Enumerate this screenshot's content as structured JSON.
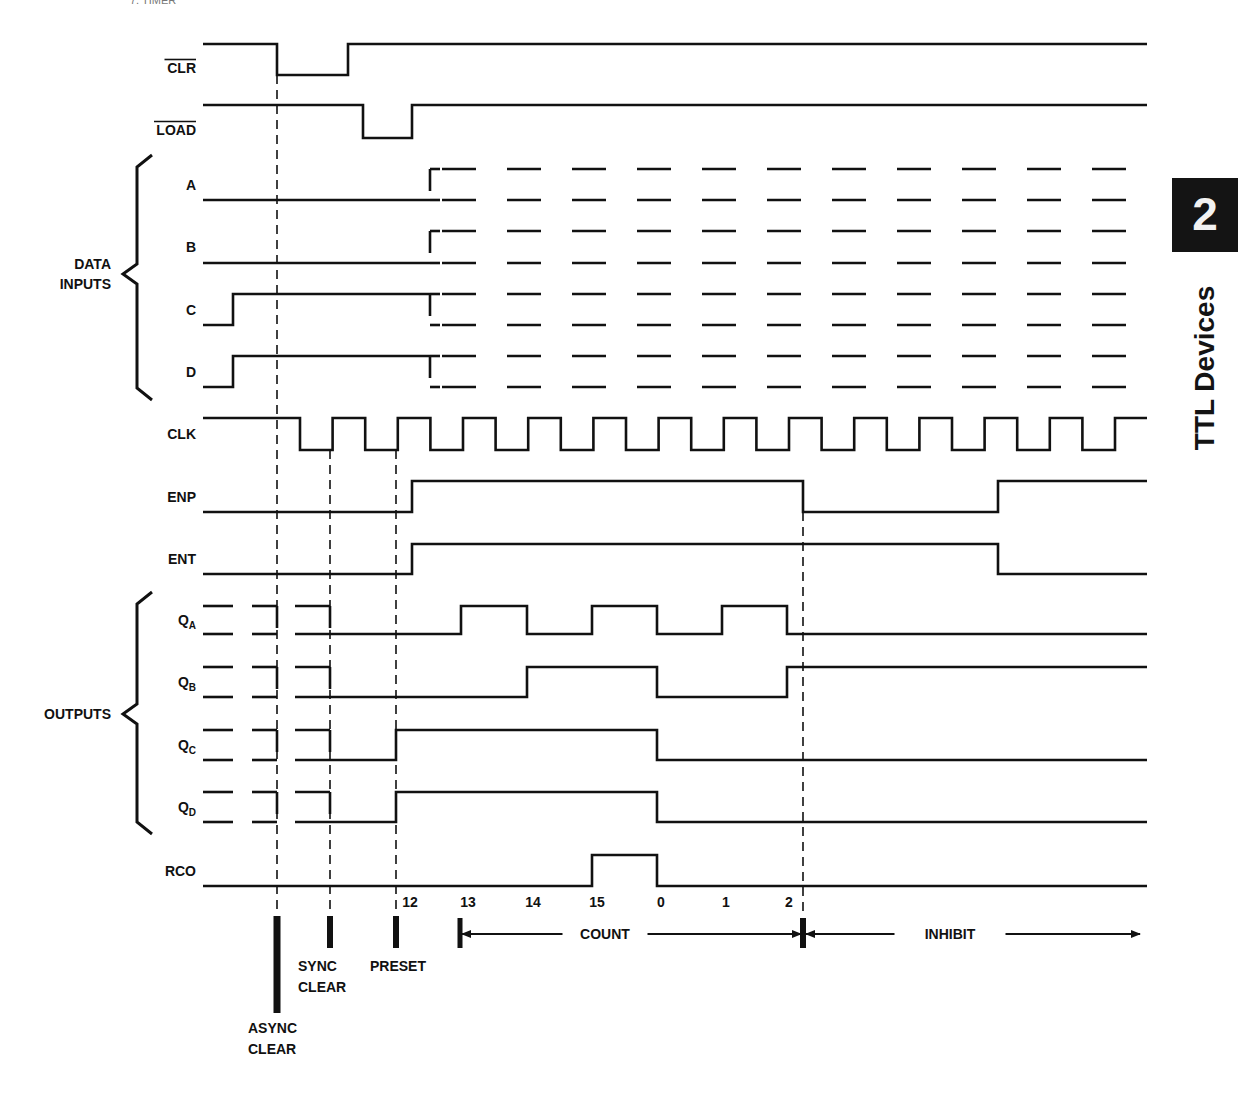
{
  "page": {
    "header_fragment": "7.  TIMER",
    "section_tab": {
      "number": "2",
      "title": "TTL Devices",
      "bg_color": "#141414"
    }
  },
  "diagram": {
    "ink_color": "#111111",
    "signals": [
      {
        "id": "clr",
        "label": "CLR",
        "overbar": true,
        "high": 44,
        "low": 75,
        "points": [
          [
            203,
            "H"
          ],
          [
            277,
            "L"
          ],
          [
            348,
            "H"
          ],
          [
            1147,
            "H"
          ]
        ]
      },
      {
        "id": "load",
        "label": "LOAD",
        "overbar": true,
        "high": 105,
        "low": 138,
        "points": [
          [
            203,
            "H"
          ],
          [
            363,
            "L"
          ],
          [
            412,
            "H"
          ],
          [
            1147,
            "H"
          ]
        ]
      },
      {
        "id": "a",
        "label": "A",
        "group": "data",
        "high": 169,
        "low": 200,
        "points": [
          [
            203,
            "L"
          ],
          [
            430,
            "L"
          ]
        ],
        "dont_care_from": 430
      },
      {
        "id": "b",
        "label": "B",
        "group": "data",
        "high": 231,
        "low": 263,
        "points": [
          [
            203,
            "L"
          ],
          [
            430,
            "L"
          ]
        ],
        "dont_care_from": 430
      },
      {
        "id": "c",
        "label": "C",
        "group": "data",
        "high": 294,
        "low": 325,
        "points": [
          [
            203,
            "L"
          ],
          [
            233,
            "H"
          ],
          [
            430,
            "H"
          ]
        ],
        "dont_care_from": 430
      },
      {
        "id": "d",
        "label": "D",
        "group": "data",
        "high": 356,
        "low": 387,
        "points": [
          [
            203,
            "L"
          ],
          [
            233,
            "H"
          ],
          [
            430,
            "H"
          ]
        ],
        "dont_care_from": 430
      },
      {
        "id": "clk",
        "label": "CLK",
        "high": 418,
        "low": 450,
        "clock": {
          "start": 203,
          "first_fall": 300,
          "half_period": 32.6,
          "end": 1147,
          "cycles": 13
        }
      },
      {
        "id": "enp",
        "label": "ENP",
        "high": 481,
        "low": 512,
        "points": [
          [
            203,
            "L"
          ],
          [
            412,
            "H"
          ],
          [
            803,
            "L"
          ],
          [
            998,
            "H"
          ],
          [
            1147,
            "H"
          ]
        ]
      },
      {
        "id": "ent",
        "label": "ENT",
        "high": 544,
        "low": 574,
        "points": [
          [
            203,
            "L"
          ],
          [
            412,
            "H"
          ],
          [
            998,
            "L"
          ],
          [
            1147,
            "L"
          ]
        ]
      },
      {
        "id": "qa",
        "label": "Q",
        "sub": "A",
        "group": "out",
        "high": 606,
        "low": 634,
        "dont_care_until": 330,
        "points": [
          [
            330,
            "L"
          ],
          [
            461,
            "H"
          ],
          [
            527,
            "L"
          ],
          [
            592,
            "H"
          ],
          [
            657,
            "L"
          ],
          [
            722,
            "H"
          ],
          [
            787,
            "L"
          ],
          [
            1147,
            "L"
          ]
        ]
      },
      {
        "id": "qb",
        "label": "Q",
        "sub": "B",
        "group": "out",
        "high": 667,
        "low": 697,
        "dont_care_until": 330,
        "points": [
          [
            330,
            "L"
          ],
          [
            527,
            "H"
          ],
          [
            657,
            "L"
          ],
          [
            787,
            "H"
          ],
          [
            1147,
            "H"
          ]
        ]
      },
      {
        "id": "qc",
        "label": "Q",
        "sub": "C",
        "group": "out",
        "high": 730,
        "low": 760,
        "dont_care_until": 330,
        "points": [
          [
            330,
            "L"
          ],
          [
            396,
            "H"
          ],
          [
            657,
            "L"
          ],
          [
            1147,
            "L"
          ]
        ]
      },
      {
        "id": "qd",
        "label": "Q",
        "sub": "D",
        "group": "out",
        "high": 792,
        "low": 822,
        "dont_care_until": 330,
        "points": [
          [
            330,
            "L"
          ],
          [
            396,
            "H"
          ],
          [
            657,
            "L"
          ],
          [
            1147,
            "L"
          ]
        ]
      },
      {
        "id": "rco",
        "label": "RCO",
        "high": 855,
        "low": 886,
        "points": [
          [
            203,
            "L"
          ],
          [
            592,
            "H"
          ],
          [
            657,
            "L"
          ],
          [
            1147,
            "L"
          ]
        ]
      }
    ],
    "groups": [
      {
        "id": "data",
        "label_lines": [
          "DATA",
          "INPUTS"
        ],
        "top": 155,
        "bottom": 400,
        "mid": 274
      },
      {
        "id": "out",
        "label_lines": [
          "OUTPUTS"
        ],
        "top": 592,
        "bottom": 834,
        "mid": 714
      }
    ],
    "event_lines": [
      {
        "id": "async-clear",
        "x": 277,
        "y1": 75,
        "y2": 915
      },
      {
        "id": "sync-clear",
        "x": 330,
        "y1": 450,
        "y2": 915
      },
      {
        "id": "preset",
        "x": 396,
        "y1": 450,
        "y2": 915
      },
      {
        "id": "inhibit",
        "x": 803,
        "y1": 512,
        "y2": 915
      }
    ],
    "count_labels": [
      {
        "text": "12",
        "x": 410
      },
      {
        "text": "13",
        "x": 468
      },
      {
        "text": "14",
        "x": 533
      },
      {
        "text": "15",
        "x": 597
      },
      {
        "text": "0",
        "x": 661
      },
      {
        "text": "1",
        "x": 726
      },
      {
        "text": "2",
        "x": 789
      }
    ],
    "count_labels_y": 907,
    "markers": [
      {
        "id": "async-clear-marker",
        "x": 277,
        "y1": 916,
        "y2": 1013,
        "w": 7
      },
      {
        "id": "sync-clear-marker",
        "x": 330,
        "y1": 916,
        "y2": 948,
        "w": 6
      },
      {
        "id": "preset-marker",
        "x": 396,
        "y1": 916,
        "y2": 948,
        "w": 6
      },
      {
        "id": "count-start-marker",
        "x": 460,
        "y1": 918,
        "y2": 948,
        "w": 5
      },
      {
        "id": "inhibit-marker",
        "x": 803,
        "y1": 918,
        "y2": 948,
        "w": 6
      }
    ],
    "annotations": [
      {
        "id": "async-clear-label",
        "lines": [
          "ASYNC",
          "CLEAR"
        ],
        "x": 248,
        "y": 1033
      },
      {
        "id": "sync-clear-label",
        "lines": [
          "SYNC",
          "CLEAR"
        ],
        "x": 298,
        "y": 971
      },
      {
        "id": "preset-label",
        "lines": [
          "PRESET"
        ],
        "x": 370,
        "y": 971
      }
    ],
    "spans": [
      {
        "id": "count-span",
        "label": "COUNT",
        "x1": 462,
        "x2": 801,
        "y": 934,
        "label_x": 605,
        "both_arrows": true
      },
      {
        "id": "inhibit-span",
        "label": "INHIBIT",
        "x1": 806,
        "x2": 1140,
        "y": 934,
        "label_x": 950,
        "both_arrows": false
      }
    ],
    "dont_care": {
      "dash_start": 432,
      "dash_period": 65,
      "dash_len": 34,
      "end": 1147
    }
  }
}
